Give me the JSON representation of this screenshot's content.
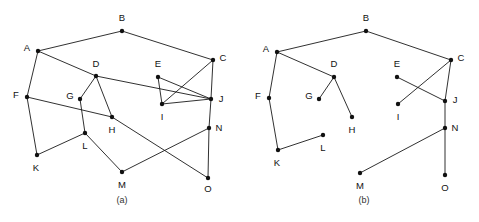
{
  "figure": {
    "width": 479,
    "height": 222,
    "background_color": "#ffffff",
    "edge_color": "#1a1a1a",
    "vertex_color": "#111111",
    "label_color": "#111111",
    "caption_color": "#333333"
  },
  "panels": [
    {
      "id": "panel-a",
      "caption": "(a)",
      "caption_x": 122,
      "caption_y": 201,
      "description": "graph with fifteen vertices and twenty-two edges",
      "vertices": [
        {
          "id": "A",
          "label": "A",
          "x": 38,
          "y": 51,
          "lx": 27,
          "ly": 48
        },
        {
          "id": "B",
          "label": "B",
          "x": 122,
          "y": 31,
          "lx": 122,
          "ly": 18
        },
        {
          "id": "C",
          "label": "C",
          "x": 213,
          "y": 60,
          "lx": 223,
          "ly": 58
        },
        {
          "id": "D",
          "label": "D",
          "x": 96,
          "y": 76,
          "lx": 96,
          "ly": 64
        },
        {
          "id": "E",
          "label": "E",
          "x": 158,
          "y": 77,
          "lx": 158,
          "ly": 64
        },
        {
          "id": "F",
          "label": "F",
          "x": 27,
          "y": 97,
          "lx": 16,
          "ly": 95
        },
        {
          "id": "G",
          "label": "G",
          "x": 80,
          "y": 99,
          "lx": 70,
          "ly": 96
        },
        {
          "id": "H",
          "label": "H",
          "x": 112,
          "y": 117,
          "lx": 112,
          "ly": 130
        },
        {
          "id": "I",
          "label": "I",
          "x": 162,
          "y": 104,
          "lx": 162,
          "ly": 117
        },
        {
          "id": "J",
          "label": "J",
          "x": 211,
          "y": 99,
          "lx": 221,
          "ly": 99
        },
        {
          "id": "K",
          "label": "K",
          "x": 37,
          "y": 155,
          "lx": 36,
          "ly": 168
        },
        {
          "id": "L",
          "label": "L",
          "x": 85,
          "y": 133,
          "lx": 85,
          "ly": 146
        },
        {
          "id": "M",
          "label": "M",
          "x": 122,
          "y": 172,
          "lx": 122,
          "ly": 185
        },
        {
          "id": "N",
          "label": "N",
          "x": 209,
          "y": 128,
          "lx": 219,
          "ly": 128
        },
        {
          "id": "O",
          "label": "O",
          "x": 208,
          "y": 178,
          "lx": 208,
          "ly": 189
        }
      ],
      "edges": [
        {
          "from": "A",
          "to": "B"
        },
        {
          "from": "B",
          "to": "C"
        },
        {
          "from": "A",
          "to": "F"
        },
        {
          "from": "A",
          "to": "D"
        },
        {
          "from": "D",
          "to": "J"
        },
        {
          "from": "D",
          "to": "G"
        },
        {
          "from": "D",
          "to": "H"
        },
        {
          "from": "G",
          "to": "L"
        },
        {
          "from": "F",
          "to": "H"
        },
        {
          "from": "F",
          "to": "K"
        },
        {
          "from": "K",
          "to": "L"
        },
        {
          "from": "L",
          "to": "M"
        },
        {
          "from": "H",
          "to": "O"
        },
        {
          "from": "M",
          "to": "N"
        },
        {
          "from": "E",
          "to": "I"
        },
        {
          "from": "E",
          "to": "J"
        },
        {
          "from": "C",
          "to": "I"
        },
        {
          "from": "C",
          "to": "J"
        },
        {
          "from": "I",
          "to": "J"
        },
        {
          "from": "J",
          "to": "N"
        },
        {
          "from": "N",
          "to": "O"
        }
      ]
    },
    {
      "id": "panel-b",
      "caption": "(b)",
      "caption_x": 364,
      "caption_y": 201,
      "description": "spanning forest of the graph in panel a",
      "vertices": [
        {
          "id": "A",
          "label": "A",
          "x": 277,
          "y": 52,
          "lx": 266,
          "ly": 49
        },
        {
          "id": "B",
          "label": "B",
          "x": 366,
          "y": 31,
          "lx": 366,
          "ly": 18
        },
        {
          "id": "C",
          "label": "C",
          "x": 451,
          "y": 60,
          "lx": 461,
          "ly": 58
        },
        {
          "id": "D",
          "label": "D",
          "x": 334,
          "y": 77,
          "lx": 334,
          "ly": 64
        },
        {
          "id": "E",
          "label": "E",
          "x": 397,
          "y": 77,
          "lx": 397,
          "ly": 64
        },
        {
          "id": "F",
          "label": "F",
          "x": 269,
          "y": 98,
          "lx": 258,
          "ly": 96
        },
        {
          "id": "G",
          "label": "G",
          "x": 319,
          "y": 99,
          "lx": 309,
          "ly": 96
        },
        {
          "id": "H",
          "label": "H",
          "x": 352,
          "y": 117,
          "lx": 352,
          "ly": 130
        },
        {
          "id": "I",
          "label": "I",
          "x": 398,
          "y": 104,
          "lx": 398,
          "ly": 117
        },
        {
          "id": "J",
          "label": "J",
          "x": 445,
          "y": 101,
          "lx": 455,
          "ly": 100
        },
        {
          "id": "K",
          "label": "K",
          "x": 278,
          "y": 150,
          "lx": 277,
          "ly": 163
        },
        {
          "id": "L",
          "label": "L",
          "x": 323,
          "y": 135,
          "lx": 323,
          "ly": 148
        },
        {
          "id": "M",
          "label": "M",
          "x": 360,
          "y": 173,
          "lx": 360,
          "ly": 186
        },
        {
          "id": "N",
          "label": "N",
          "x": 445,
          "y": 128,
          "lx": 455,
          "ly": 128
        },
        {
          "id": "O",
          "label": "O",
          "x": 445,
          "y": 175,
          "lx": 445,
          "ly": 188
        }
      ],
      "edges": [
        {
          "from": "A",
          "to": "B"
        },
        {
          "from": "B",
          "to": "C"
        },
        {
          "from": "A",
          "to": "D"
        },
        {
          "from": "A",
          "to": "F"
        },
        {
          "from": "D",
          "to": "G"
        },
        {
          "from": "D",
          "to": "H"
        },
        {
          "from": "F",
          "to": "K"
        },
        {
          "from": "K",
          "to": "L"
        },
        {
          "from": "E",
          "to": "J"
        },
        {
          "from": "C",
          "to": "I"
        },
        {
          "from": "C",
          "to": "J"
        },
        {
          "from": "J",
          "to": "N"
        },
        {
          "from": "N",
          "to": "M"
        },
        {
          "from": "N",
          "to": "O"
        }
      ]
    }
  ]
}
